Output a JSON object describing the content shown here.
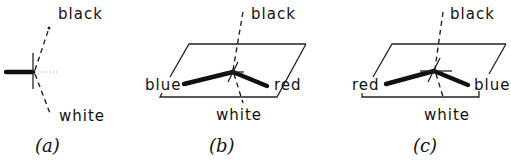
{
  "figure": {
    "panels": [
      {
        "id": "a",
        "caption": "(a)",
        "labels": {
          "top": "black",
          "bottom": "white"
        }
      },
      {
        "id": "b",
        "caption": "(b)",
        "labels": {
          "top": "black",
          "bottom": "white",
          "left": "blue",
          "right": "red"
        }
      },
      {
        "id": "c",
        "caption": "(c)",
        "labels": {
          "top": "black",
          "bottom": "white",
          "left": "red",
          "right": "blue"
        }
      }
    ]
  }
}
